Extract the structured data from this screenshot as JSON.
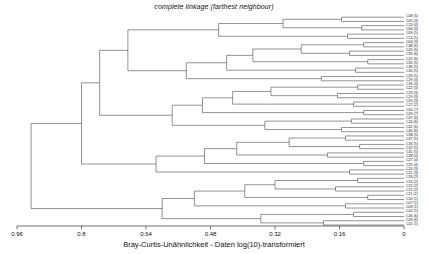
{
  "chart_data": {
    "type": "dendrogram",
    "title": "complete linkage (farthest neighbour)",
    "xlabel": "Bray-Curtis-Unähnlichkeit - Daten log(10)-transformiert",
    "ylabel": "",
    "axis": {
      "orientation": "horizontal-reversed",
      "xlim": [
        0.96,
        0.0
      ],
      "ticks": [
        0.96,
        0.8,
        0.64,
        0.48,
        0.32,
        0.16,
        0
      ],
      "ticklabels": [
        "0.96",
        "0.8",
        "0.64",
        "0.48",
        "0.32",
        "0.16",
        "0"
      ],
      "grid": false
    },
    "linkage_method": "complete",
    "distance_metric": "Bray-Curtis dissimilarity",
    "transform": "log(10)",
    "n_leaves": 50,
    "leaf_labels": [
      "C08 (5)",
      "C05 (4)",
      "C13 (4)",
      "C06 (4)",
      "C09 (5)",
      "C14 (5)",
      "C04 (3)",
      "C48 (6)",
      "C45 (6)",
      "C39 (6)",
      "C41 (6)",
      "C35 (5)",
      "C36 (5)",
      "C30 (5)",
      "C33 (5)",
      "C29 (4)",
      "C26 (4)",
      "C22 (3)",
      "C23 (3)",
      "C19 (3)",
      "C20 (3)",
      "C17 (2)",
      "C50 (7)",
      "C49 (7)",
      "C47 (6)",
      "C44 (6)",
      "C42 (6)",
      "C40 (6)",
      "C38 (5)",
      "C37 (5)",
      "C34 (5)",
      "C32 (5)",
      "C31 (5)",
      "C28 (4)",
      "C27 (4)",
      "C25 (4)",
      "C24 (3)",
      "C21 (3)",
      "C18 (2)",
      "C16 (2)",
      "C15 (2)",
      "C12 (2)",
      "C11 (2)",
      "C10 (1)",
      "C07 (1)",
      "C03 (1)",
      "C02 (1)",
      "C46 (6)",
      "C43 (6)",
      "C01 (1)"
    ],
    "merges": [
      {
        "id": 50,
        "left": 0,
        "right": 1,
        "height": 0.155
      },
      {
        "id": 51,
        "left": 2,
        "right": 3,
        "height": 0.105
      },
      {
        "id": 52,
        "left": 50,
        "right": 51,
        "height": 0.3
      },
      {
        "id": 53,
        "left": 4,
        "right": 5,
        "height": 0.14
      },
      {
        "id": 54,
        "left": 52,
        "right": 53,
        "height": 0.46
      },
      {
        "id": 55,
        "left": 6,
        "right": 7,
        "height": 0.1
      },
      {
        "id": 56,
        "left": 8,
        "right": 9,
        "height": 0.135
      },
      {
        "id": 57,
        "left": 55,
        "right": 56,
        "height": 0.255
      },
      {
        "id": 58,
        "left": 10,
        "right": 11,
        "height": 0.09
      },
      {
        "id": 59,
        "left": 57,
        "right": 58,
        "height": 0.375
      },
      {
        "id": 60,
        "left": 12,
        "right": 13,
        "height": 0.12
      },
      {
        "id": 61,
        "left": 59,
        "right": 60,
        "height": 0.44
      },
      {
        "id": 62,
        "left": 14,
        "right": 15,
        "height": 0.205
      },
      {
        "id": 63,
        "left": 61,
        "right": 62,
        "height": 0.54
      },
      {
        "id": 64,
        "left": 54,
        "right": 63,
        "height": 0.685
      },
      {
        "id": 65,
        "left": 16,
        "right": 17,
        "height": 0.115
      },
      {
        "id": 66,
        "left": 18,
        "right": 19,
        "height": 0.165
      },
      {
        "id": 67,
        "left": 65,
        "right": 66,
        "height": 0.33
      },
      {
        "id": 68,
        "left": 20,
        "right": 21,
        "height": 0.125
      },
      {
        "id": 69,
        "left": 67,
        "right": 68,
        "height": 0.425
      },
      {
        "id": 70,
        "left": 22,
        "right": 23,
        "height": 0.1
      },
      {
        "id": 71,
        "left": 69,
        "right": 70,
        "height": 0.5
      },
      {
        "id": 72,
        "left": 24,
        "right": 25,
        "height": 0.13
      },
      {
        "id": 73,
        "left": 26,
        "right": 27,
        "height": 0.155
      },
      {
        "id": 74,
        "left": 72,
        "right": 73,
        "height": 0.345
      },
      {
        "id": 75,
        "left": 71,
        "right": 74,
        "height": 0.575
      },
      {
        "id": 76,
        "left": 64,
        "right": 75,
        "height": 0.755
      },
      {
        "id": 77,
        "left": 28,
        "right": 29,
        "height": 0.145
      },
      {
        "id": 78,
        "left": 30,
        "right": 31,
        "height": 0.11
      },
      {
        "id": 79,
        "left": 77,
        "right": 78,
        "height": 0.285
      },
      {
        "id": 80,
        "left": 32,
        "right": 33,
        "height": 0.19
      },
      {
        "id": 81,
        "left": 79,
        "right": 80,
        "height": 0.415
      },
      {
        "id": 82,
        "left": 34,
        "right": 35,
        "height": 0.1
      },
      {
        "id": 83,
        "left": 81,
        "right": 82,
        "height": 0.495
      },
      {
        "id": 84,
        "left": 36,
        "right": 37,
        "height": 0.135
      },
      {
        "id": 85,
        "left": 83,
        "right": 84,
        "height": 0.615
      },
      {
        "id": 86,
        "left": 76,
        "right": 85,
        "height": 0.8
      },
      {
        "id": 87,
        "left": 38,
        "right": 39,
        "height": 0.115
      },
      {
        "id": 88,
        "left": 40,
        "right": 41,
        "height": 0.17
      },
      {
        "id": 89,
        "left": 87,
        "right": 88,
        "height": 0.32
      },
      {
        "id": 90,
        "left": 42,
        "right": 43,
        "height": 0.09
      },
      {
        "id": 91,
        "left": 89,
        "right": 90,
        "height": 0.395
      },
      {
        "id": 92,
        "left": 44,
        "right": 45,
        "height": 0.145
      },
      {
        "id": 93,
        "left": 91,
        "right": 92,
        "height": 0.52
      },
      {
        "id": 94,
        "left": 46,
        "right": 47,
        "height": 0.125
      },
      {
        "id": 95,
        "left": 48,
        "right": 49,
        "height": 0.2
      },
      {
        "id": 96,
        "left": 94,
        "right": 95,
        "height": 0.355
      },
      {
        "id": 97,
        "left": 93,
        "right": 96,
        "height": 0.6
      },
      {
        "id": 98,
        "left": 86,
        "right": 97,
        "height": 0.925
      }
    ]
  },
  "colors": {
    "line": "#4a4a4a",
    "axis": "#333333",
    "text": "#111111",
    "background": "#ffffff"
  }
}
